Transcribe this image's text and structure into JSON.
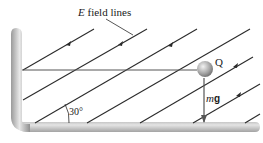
{
  "labels": {
    "efield_symbol": "E",
    "efield_text": " field lines",
    "charge": "Q",
    "weight_m": "m",
    "weight_g": "g",
    "angle": "30°"
  },
  "colors": {
    "field_line": "#2b2b2b",
    "wall_light": "#e6e6e6",
    "wall_dark": "#8c8c8c",
    "string": "#555555",
    "ball_light": "#eeeeee",
    "ball_dark": "#7a7a7a",
    "weight_arrow": "#555555"
  },
  "geometry": {
    "field_angle_deg": 30,
    "field_line_count": 7
  }
}
